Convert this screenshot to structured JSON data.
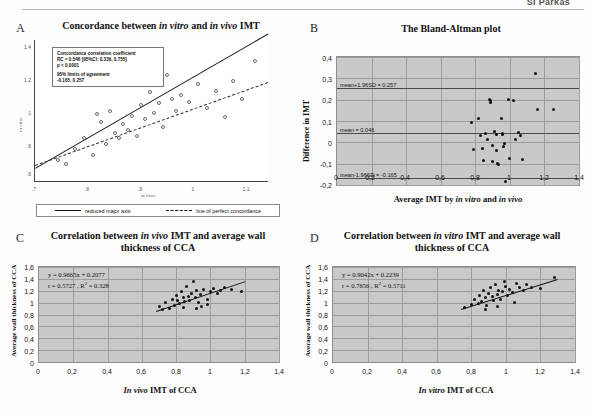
{
  "header": {
    "running_head": "SI Parkas"
  },
  "panels": {
    "A": {
      "letter": "A",
      "title_pre": "Concordance between ",
      "title_it1": "in vitro",
      "title_mid": " and ",
      "title_it2": "in vivo",
      "title_post": " IMT",
      "stats": {
        "line1": "Concordance correlation coefficient",
        "line2": "RC = 0.546 [95%CI: 0.336, 0.755]",
        "line3": "p < 0.0001",
        "line4": "95% limits of agreement",
        "line5": "-0.165, 0.257"
      },
      "y_label": "in vitro",
      "x_label": "in vivo",
      "y_ticks": [
        "1.4",
        "1.2",
        "1",
        ".8",
        ".6"
      ],
      "x_ticks": [
        ".7",
        ".8",
        ".9",
        "1",
        "1.1"
      ],
      "legend": [
        {
          "label": "reduced major axis",
          "style": "solid"
        },
        {
          "label": "line of perfect concordance",
          "style": "dashed"
        }
      ]
    },
    "B": {
      "letter": "B",
      "title": "The Bland-Altman plot",
      "y_label": "Difference in IMT",
      "x_label_pre": "Average IMT by ",
      "x_label_it1": "in vitro",
      "x_label_mid": " and ",
      "x_label_it2": "in vivo",
      "y_ticks": [
        "0,4",
        "0,3",
        "0,2",
        "0,1",
        "0",
        "-0,1",
        "-0,2"
      ],
      "x_ticks": [
        "0",
        "0,2",
        "0,4",
        "0,6",
        "0,8",
        "1",
        "1,2",
        "1,4"
      ],
      "reflines": [
        {
          "text": "mean+1.96SD = 0.257",
          "value": 0.257
        },
        {
          "text": "mean = 0.046",
          "value": 0.046
        },
        {
          "text": "mean-1.96SD = -0.165",
          "value": -0.165
        }
      ]
    },
    "C": {
      "letter": "C",
      "title_pre": "Correlation between ",
      "title_it": "in vivo",
      "title_post": " IMT and average wall thickness of CCA",
      "equation": "y = 0.9665x + 0.2077",
      "stats_r": "r = 0.5727 ,  R",
      "stats_r_sup": "2",
      "stats_r_tail": " = 0.328",
      "y_label": "Average wall thickness of CCA",
      "x_label_it": "In vivo",
      "x_label_post": " IMT of CCA",
      "y_ticks": [
        "1,6",
        "1,4",
        "1,2",
        "1",
        "0,8",
        "0,6",
        "0,4",
        "0,2",
        "0"
      ],
      "x_ticks": [
        "0",
        "0,2",
        "0,4",
        "0,6",
        "0,8",
        "1",
        "1,2",
        "1,4"
      ]
    },
    "D": {
      "letter": "D",
      "title_pre": "Correlation between ",
      "title_it": "in vitro",
      "title_post": " IMT and average wall thickness of CCA",
      "equation": "y = 0.9042x + 0.2239",
      "stats_r": "r = 0.7656 ,  R",
      "stats_r_sup": "2",
      "stats_r_tail": " = 0.5711",
      "y_label": "Average wall thickness of CCA",
      "x_label_it": "In vitro",
      "x_label_post": " IMT of CCA",
      "y_ticks": [
        "1,6",
        "1,4",
        "1,2",
        "1",
        "0,8",
        "0,6",
        "0,4",
        "0,2",
        "0"
      ],
      "x_ticks": [
        "0",
        "0,2",
        "0,4",
        "0,6",
        "0,8",
        "1",
        "1,2",
        "1,4"
      ]
    }
  },
  "chart_data": [
    {
      "panel": "A",
      "type": "scatter",
      "title": "Concordance between in vitro and in vivo IMT",
      "xlabel": "in vivo",
      "ylabel": "in vitro",
      "xlim": [
        0.65,
        1.18
      ],
      "ylim": [
        0.55,
        1.45
      ],
      "grid": false,
      "legend_position": "bottom",
      "annotations": [
        "Concordance correlation coefficient",
        "RC = 0.546 [95%CI: 0.336, 0.755]",
        "p < 0.0001",
        "95% limits of agreement",
        "-0.165, 0.257"
      ],
      "points": [
        [
          0.7,
          0.69
        ],
        [
          0.72,
          0.66
        ],
        [
          0.74,
          0.76
        ],
        [
          0.76,
          0.83
        ],
        [
          0.78,
          0.72
        ],
        [
          0.79,
          0.98
        ],
        [
          0.8,
          0.93
        ],
        [
          0.81,
          0.79
        ],
        [
          0.82,
          1.0
        ],
        [
          0.83,
          0.86
        ],
        [
          0.84,
          0.83
        ],
        [
          0.85,
          0.92
        ],
        [
          0.86,
          0.88
        ],
        [
          0.87,
          0.97
        ],
        [
          0.88,
          0.84
        ],
        [
          0.89,
          1.04
        ],
        [
          0.9,
          0.95
        ],
        [
          0.91,
          1.12
        ],
        [
          0.92,
          0.99
        ],
        [
          0.93,
          1.05
        ],
        [
          0.94,
          0.9
        ],
        [
          0.95,
          1.23
        ],
        [
          0.96,
          1.08
        ],
        [
          0.97,
          1.0
        ],
        [
          0.98,
          1.1
        ],
        [
          1.0,
          1.06
        ],
        [
          1.02,
          1.17
        ],
        [
          1.04,
          1.02
        ],
        [
          1.06,
          1.13
        ],
        [
          1.08,
          0.96
        ],
        [
          1.1,
          1.19
        ],
        [
          1.12,
          1.08
        ],
        [
          1.15,
          1.32
        ],
        [
          0.86,
          1.35
        ],
        [
          0.78,
          1.22
        ]
      ],
      "series": [
        {
          "name": "reduced major axis",
          "style": "solid",
          "slope": 1.62,
          "intercept": -0.42
        },
        {
          "name": "line of perfect concordance",
          "style": "dashed",
          "slope": 1.0,
          "intercept": 0.0
        }
      ]
    },
    {
      "panel": "B",
      "type": "scatter",
      "title": "The Bland-Altman plot",
      "xlabel": "Average IMT by in vitro and in vivo",
      "ylabel": "Difference in IMT",
      "xlim": [
        0,
        1.4
      ],
      "ylim": [
        -0.2,
        0.4
      ],
      "grid": true,
      "reference_lines": [
        {
          "label": "mean+1.96SD = 0.257",
          "y": 0.257
        },
        {
          "label": "mean = 0.046",
          "y": 0.046
        },
        {
          "label": "mean-1.96SD = -0.165",
          "y": -0.165
        }
      ],
      "points": [
        [
          0.78,
          0.095
        ],
        [
          0.79,
          -0.035
        ],
        [
          0.82,
          0.11
        ],
        [
          0.83,
          0.03
        ],
        [
          0.84,
          -0.03
        ],
        [
          0.85,
          -0.085
        ],
        [
          0.86,
          0.04
        ],
        [
          0.87,
          0.015
        ],
        [
          0.88,
          0.2
        ],
        [
          0.885,
          0.195
        ],
        [
          0.89,
          0.185
        ],
        [
          0.9,
          -0.015
        ],
        [
          0.9,
          -0.09
        ],
        [
          0.91,
          0.05
        ],
        [
          0.92,
          0.035
        ],
        [
          0.925,
          -0.04
        ],
        [
          0.93,
          -0.1
        ],
        [
          0.935,
          -0.105
        ],
        [
          0.95,
          0.11
        ],
        [
          0.955,
          0.04
        ],
        [
          0.96,
          0.035
        ],
        [
          0.965,
          -0.02
        ],
        [
          0.97,
          -0.005
        ],
        [
          0.975,
          -0.185
        ],
        [
          0.99,
          0.2
        ],
        [
          1.0,
          -0.075
        ],
        [
          1.02,
          0.195
        ],
        [
          1.03,
          0.015
        ],
        [
          1.05,
          0.045
        ],
        [
          1.06,
          0.03
        ],
        [
          1.07,
          -0.08
        ],
        [
          1.15,
          0.325
        ],
        [
          1.16,
          0.155
        ],
        [
          1.25,
          0.155
        ]
      ]
    },
    {
      "panel": "C",
      "type": "scatter",
      "title": "Correlation between in vivo IMT and average wall thickness of CCA",
      "xlabel": "In vivo IMT of CCA",
      "ylabel": "Average wall thickness of CCA",
      "xlim": [
        0,
        1.4
      ],
      "ylim": [
        0,
        1.6
      ],
      "grid": true,
      "fit": {
        "equation": "y = 0.9665x + 0.2077",
        "slope": 0.9665,
        "intercept": 0.2077,
        "r": 0.5727,
        "r_squared": 0.328
      },
      "points": [
        [
          0.7,
          0.93
        ],
        [
          0.72,
          0.88
        ],
        [
          0.74,
          1.0
        ],
        [
          0.76,
          0.9
        ],
        [
          0.78,
          1.05
        ],
        [
          0.79,
          0.95
        ],
        [
          0.8,
          1.12
        ],
        [
          0.81,
          1.03
        ],
        [
          0.82,
          0.99
        ],
        [
          0.83,
          1.18
        ],
        [
          0.84,
          1.08
        ],
        [
          0.85,
          1.02
        ],
        [
          0.86,
          1.28
        ],
        [
          0.87,
          1.1
        ],
        [
          0.88,
          1.04
        ],
        [
          0.89,
          1.15
        ],
        [
          0.9,
          1.36
        ],
        [
          0.91,
          1.09
        ],
        [
          0.92,
          1.2
        ],
        [
          0.93,
          1.0
        ],
        [
          0.94,
          1.13
        ],
        [
          0.95,
          0.94
        ],
        [
          0.96,
          1.22
        ],
        [
          0.98,
          1.05
        ],
        [
          1.0,
          1.18
        ],
        [
          1.02,
          1.24
        ],
        [
          1.04,
          1.16
        ],
        [
          1.06,
          1.21
        ],
        [
          1.08,
          1.26
        ],
        [
          1.12,
          1.22
        ],
        [
          1.18,
          1.19
        ],
        [
          0.84,
          0.92
        ],
        [
          0.92,
          0.9
        ],
        [
          0.98,
          0.97
        ]
      ]
    },
    {
      "panel": "D",
      "type": "scatter",
      "title": "Correlation between in vitro IMT and average wall thickness of CCA",
      "xlabel": "In vitro IMT of CCA",
      "ylabel": "Average wall thickness of CCA",
      "xlim": [
        0,
        1.4
      ],
      "ylim": [
        0,
        1.6
      ],
      "grid": true,
      "fit": {
        "equation": "y = 0.9042x + 0.2239",
        "slope": 0.9042,
        "intercept": 0.2239,
        "r": 0.7656,
        "r_squared": 0.5711
      },
      "points": [
        [
          0.76,
          0.92
        ],
        [
          0.8,
          0.97
        ],
        [
          0.82,
          1.05
        ],
        [
          0.84,
          0.99
        ],
        [
          0.85,
          1.12
        ],
        [
          0.86,
          1.02
        ],
        [
          0.87,
          1.2
        ],
        [
          0.88,
          1.08
        ],
        [
          0.89,
          0.95
        ],
        [
          0.9,
          1.16
        ],
        [
          0.91,
          1.25
        ],
        [
          0.92,
          1.1
        ],
        [
          0.93,
          1.04
        ],
        [
          0.94,
          1.3
        ],
        [
          0.95,
          1.14
        ],
        [
          0.96,
          1.21
        ],
        [
          0.97,
          1.06
        ],
        [
          0.98,
          1.18
        ],
        [
          1.0,
          1.28
        ],
        [
          1.01,
          1.12
        ],
        [
          1.02,
          1.22
        ],
        [
          1.04,
          1.17
        ],
        [
          1.06,
          1.33
        ],
        [
          1.08,
          1.25
        ],
        [
          1.1,
          1.2
        ],
        [
          1.12,
          1.3
        ],
        [
          1.15,
          1.26
        ],
        [
          1.2,
          1.24
        ],
        [
          1.28,
          1.42
        ],
        [
          0.88,
          0.88
        ],
        [
          0.95,
          0.93
        ],
        [
          1.05,
          1.0
        ],
        [
          0.99,
          1.35
        ]
      ]
    }
  ]
}
